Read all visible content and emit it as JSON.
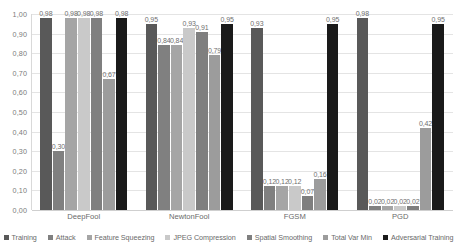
{
  "chart_data": {
    "type": "bar",
    "title": "",
    "xlabel": "",
    "ylabel": "",
    "ylim": [
      0,
      1.0
    ],
    "grid": true,
    "legend_position": "bottom",
    "decimal_separator": ",",
    "categories": [
      "DeepFool",
      "NewtonFool",
      "FGSM",
      "PGD"
    ],
    "ytick_labels": [
      "1,00",
      "0,90",
      "0,80",
      "0,70",
      "0,60",
      "0,50",
      "0,40",
      "0,30",
      "0,20",
      "0,10",
      "0,00"
    ],
    "ytick_values": [
      1.0,
      0.9,
      0.8,
      0.7,
      0.6,
      0.5,
      0.4,
      0.3,
      0.2,
      0.1,
      0.0
    ],
    "series": [
      {
        "name": "Training",
        "color": "#595959",
        "values": [
          0.98,
          0.95,
          0.93,
          0.98
        ],
        "labels": [
          "0,98",
          "0,95",
          "0,93",
          "0,98"
        ]
      },
      {
        "name": "Attack",
        "color": "#808080",
        "values": [
          0.3,
          0.84,
          0.12,
          0.02
        ],
        "labels": [
          "0,30",
          "0,84",
          "0,12",
          "0,02"
        ]
      },
      {
        "name": "Feature Squeezing",
        "color": "#a5a5a5",
        "values": [
          0.98,
          0.84,
          0.12,
          0.02
        ],
        "labels": [
          "0,98",
          "0,84",
          "0,12",
          "0,02"
        ]
      },
      {
        "name": "JPEG Compression",
        "color": "#c9c9c9",
        "values": [
          0.98,
          0.93,
          0.12,
          0.02
        ],
        "labels": [
          "0,98",
          "0,93",
          "0,12",
          "0,02"
        ]
      },
      {
        "name": "Spatial Smoothing",
        "color": "#7f7f7f",
        "values": [
          0.98,
          0.91,
          0.07,
          0.02
        ],
        "labels": [
          "0,98",
          "0,91",
          "0,07",
          "0,02"
        ]
      },
      {
        "name": "Total Var Min",
        "color": "#9c9c9c",
        "values": [
          0.67,
          0.79,
          0.16,
          0.42
        ],
        "labels": [
          "0,67",
          "0,79",
          "0,16",
          "0,42"
        ]
      },
      {
        "name": "Adversarial Training",
        "color": "#1a1a1a",
        "values": [
          0.98,
          0.95,
          0.95,
          0.95
        ],
        "labels": [
          "0,98",
          "0,95",
          "0,95",
          "0,95"
        ]
      }
    ]
  }
}
